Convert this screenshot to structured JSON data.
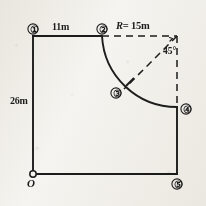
{
  "figure": {
    "background_color": "#f7f6f3",
    "ink_color": "#1c1c1c"
  },
  "dimensions": {
    "top_segment": "11m",
    "left_segment": "26m",
    "radius": "R = 15m",
    "radius_symbol": "R",
    "radius_value": "= 15m",
    "angle": "45°"
  },
  "origin": {
    "label": "O"
  },
  "nodes": [
    {
      "id": "1",
      "glyph": "①",
      "name": "node-1"
    },
    {
      "id": "2",
      "glyph": "②",
      "name": "node-2"
    },
    {
      "id": "3",
      "glyph": "③",
      "name": "node-3"
    },
    {
      "id": "4",
      "glyph": "④",
      "name": "node-4"
    },
    {
      "id": "5",
      "glyph": "⑤",
      "name": "node-5"
    }
  ],
  "geometry": {
    "solid_edges": [
      "node-1 to node-2 (top, 11m)",
      "node-1 to origin (left, 26m)",
      "origin to node-5 (bottom)",
      "node-5 to node-4 (right lower)"
    ],
    "arc": "node-2 to node-4, radius 15m, center at top-right corner",
    "dashed_edges": [
      "node-2 to top-right corner (radius line, R = 15m)",
      "top-right corner to node-4 (right upper, radius line)",
      "top-right corner to node-3 (bisector at 45 degrees)"
    ],
    "tick_mark": "perpendicular tick on arc at node-3"
  }
}
